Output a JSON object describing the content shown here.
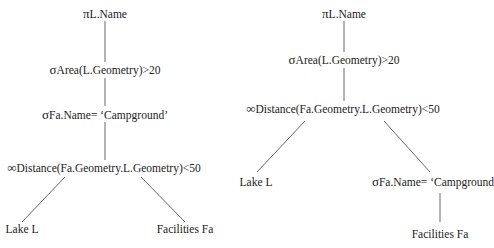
{
  "trees": [
    {
      "id": "left",
      "nodes": {
        "projection": {
          "symbol": "π",
          "text": "L.Name"
        },
        "select_area": {
          "symbol": "σ",
          "text": "Area(L.Geometry)>20"
        },
        "select_name": {
          "symbol": "σ",
          "text": "Fa.Name= ‘Campground’"
        },
        "join": {
          "symbol": "∞",
          "text": "Distance(Fa.Geometry.L.Geometry)<50"
        },
        "leaf_left": {
          "text": "Lake L"
        },
        "leaf_right": {
          "text": "Facilities Fa"
        }
      }
    },
    {
      "id": "right",
      "nodes": {
        "projection": {
          "symbol": "π",
          "text": "L.Name"
        },
        "select_area": {
          "symbol": "σ",
          "text": "Area(L.Geometry)>20"
        },
        "join": {
          "symbol": "∞",
          "text": "Distance(Fa.Geometry.L.Geometry)<50"
        },
        "leaf_left": {
          "text": "Lake L"
        },
        "select_name": {
          "symbol": "σ",
          "text": "Fa.Name= ‘Campground"
        },
        "leaf_right": {
          "text": "Facilities Fa"
        }
      }
    }
  ],
  "colors": {
    "line": "#555555",
    "text": "#222222",
    "background": "#ffffff"
  }
}
